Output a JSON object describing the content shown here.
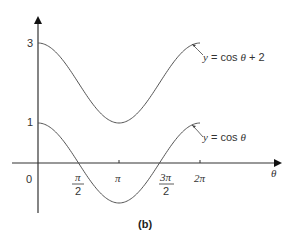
{
  "chart_data": {
    "type": "line",
    "title": "",
    "caption": "(b)",
    "xlabel": "θ",
    "ylabel": "",
    "x_ticks": [
      {
        "value": 0,
        "label": "0"
      },
      {
        "value": 1.5708,
        "label": "π/2",
        "num": "π",
        "den": "2"
      },
      {
        "value": 3.1416,
        "label": "π"
      },
      {
        "value": 4.7124,
        "label": "3π/2",
        "num": "3π",
        "den": "2"
      },
      {
        "value": 6.2832,
        "label": "2π"
      }
    ],
    "y_ticks": [
      {
        "value": 1,
        "label": "1"
      },
      {
        "value": 3,
        "label": "3"
      }
    ],
    "xlim": [
      0,
      6.2832
    ],
    "ylim": [
      -1,
      3
    ],
    "grid": false,
    "series": [
      {
        "name": "y = cos θ + 2",
        "label_parts": {
          "y": "y",
          "eq": " = cos ",
          "theta": "θ",
          "rest": " + 2"
        },
        "x": [
          0,
          0.7854,
          1.5708,
          2.3562,
          3.1416,
          3.927,
          4.7124,
          5.4978,
          6.2832
        ],
        "values": [
          3,
          2.707,
          2,
          1.293,
          1,
          1.293,
          2,
          2.707,
          3
        ]
      },
      {
        "name": "y = cos θ",
        "label_parts": {
          "y": "y",
          "eq": " = cos ",
          "theta": "θ",
          "rest": ""
        },
        "x": [
          0,
          0.7854,
          1.5708,
          2.3562,
          3.1416,
          3.927,
          4.7124,
          5.4978,
          6.2832
        ],
        "values": [
          1,
          0.707,
          0,
          -0.707,
          -1,
          -0.707,
          0,
          0.707,
          1
        ]
      }
    ]
  },
  "labels": {
    "origin": "0",
    "y3": "3",
    "y1": "1",
    "pi_num": "π",
    "two": "2",
    "pi": "π",
    "three_pi": "3π",
    "two_pi": "2π",
    "theta": "θ",
    "caption": "(b)",
    "top_y": "y",
    "top_eq": " = cos ",
    "top_theta": "θ",
    "top_rest": " + 2",
    "bot_y": "y",
    "bot_eq": " = cos ",
    "bot_theta": "θ"
  }
}
